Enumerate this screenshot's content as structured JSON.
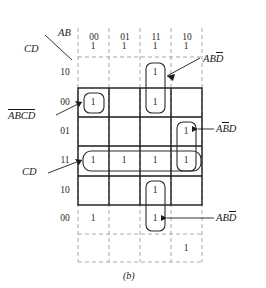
{
  "figure": {
    "caption": "(b)",
    "type": "karnaugh-map",
    "axis_corner": {
      "top_label": "AB",
      "bottom_label": "CD"
    },
    "column_headers": [
      "00",
      "01",
      "11",
      "10"
    ],
    "row_labels": [
      "10",
      "00",
      "01",
      "11",
      "10",
      "00"
    ],
    "row_labels_detail": [
      {
        "label": "10",
        "ghost": true
      },
      {
        "label": "00",
        "ghost": false
      },
      {
        "label": "01",
        "ghost": false
      },
      {
        "label": "11",
        "ghost": false
      },
      {
        "label": "10",
        "ghost": false
      },
      {
        "label": "00",
        "ghost": true
      }
    ],
    "cell_value": "1",
    "grid": [
      [
        "1",
        "1",
        "1",
        "1"
      ],
      [
        "",
        "",
        "1",
        ""
      ],
      [
        "1",
        "",
        "1",
        ""
      ],
      [
        "",
        "",
        "",
        "1"
      ],
      [
        "1",
        "1",
        "1",
        "1"
      ],
      [
        "",
        "",
        "1",
        ""
      ],
      [
        "1",
        "",
        "1",
        ""
      ],
      [
        "",
        "",
        "",
        "1"
      ]
    ],
    "annotations": [
      {
        "name": "abd-bar-top",
        "text_plain": "ABD",
        "a": "A",
        "b": "B",
        "d": "D",
        "d_bar": true,
        "b_bar": false
      },
      {
        "name": "abcd-bar-left",
        "text_plain": "ABCD",
        "all_bar": true
      },
      {
        "name": "abd-bar-right",
        "text_plain": "ABD",
        "b_bar": true,
        "d_bar": false
      },
      {
        "name": "cd-left",
        "text_plain": "CD"
      },
      {
        "name": "abd-bar-bottom",
        "text_plain": "ABD",
        "d_bar": true
      }
    ],
    "labels": {
      "ab": "AB",
      "cd": "CD",
      "abcd_overbar": "ABCD",
      "abd_topbar_d": "ABD",
      "abd_bar_b": "ABD",
      "cd_group": "CD",
      "abd_bottombar_d": "ABD"
    },
    "letters": {
      "A": "A",
      "B": "B",
      "C": "C",
      "D": "D"
    },
    "colors": {
      "line": "#1b1b1b",
      "dashed": "#9a9a9a",
      "text": "#1b1b1b",
      "background": "#ffffff"
    }
  }
}
